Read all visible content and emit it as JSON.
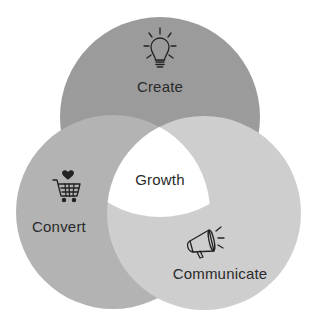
{
  "diagram": {
    "type": "venn",
    "center_label": "Growth",
    "circles": [
      {
        "label": "Create",
        "icon": "lightbulb-icon",
        "color": "#9b9b9b"
      },
      {
        "label": "Convert",
        "icon": "shopping-cart-heart-icon",
        "color": "#b3b3b3"
      },
      {
        "label": "Communicate",
        "icon": "megaphone-icon",
        "color": "#cecece"
      }
    ],
    "center_color": "#ffffff",
    "text_color": "#2a2a2a"
  }
}
